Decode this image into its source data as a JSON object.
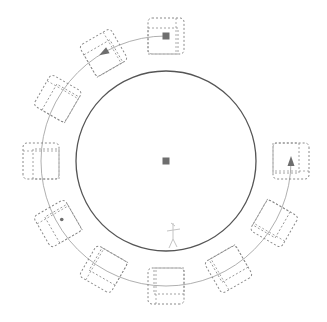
{
  "diagram": {
    "colors": {
      "background": "#ffffff",
      "table_stroke": "#555555",
      "chair_stroke": "#8a8a8a",
      "path_stroke": "#9a9a9a",
      "marker_fill": "#6e6e6e"
    },
    "table": {
      "cx": 166,
      "cy": 161,
      "r": 90,
      "center_marker": "square-marker"
    },
    "ring": {
      "r": 125
    },
    "chairs": [
      {
        "id": "chair-top",
        "angle": -90,
        "marker": "square-marker"
      },
      {
        "id": "chair-upper-left",
        "angle": -120,
        "marker": "triangle-marker"
      },
      {
        "id": "chair-left-upper",
        "angle": -150,
        "marker": ""
      },
      {
        "id": "chair-left",
        "angle": 180,
        "marker": ""
      },
      {
        "id": "chair-left-lower",
        "angle": 150,
        "marker": "dot-marker"
      },
      {
        "id": "chair-lower-left",
        "angle": 120,
        "marker": ""
      },
      {
        "id": "chair-bottom",
        "angle": 90,
        "marker": ""
      },
      {
        "id": "chair-lower-right",
        "angle": 60,
        "marker": ""
      },
      {
        "id": "chair-right-lower",
        "angle": 30,
        "marker": ""
      },
      {
        "id": "chair-right",
        "angle": 0,
        "marker": "triangle-marker"
      }
    ],
    "path_arc": {
      "from_angle": 0,
      "to_angle": 270,
      "direction": "clockwise"
    },
    "person_sketch": {
      "x": 173,
      "y": 235
    }
  }
}
